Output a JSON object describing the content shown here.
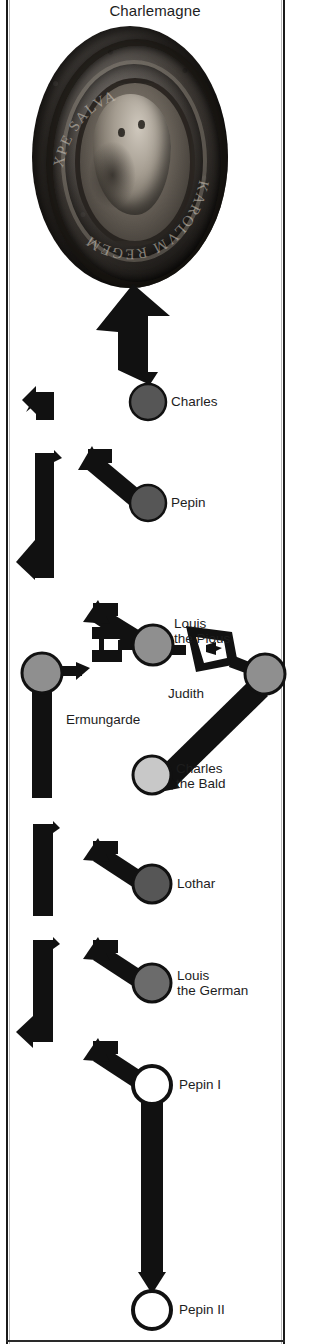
{
  "title": "Charlemagne",
  "portrait": {
    "icon": "seal-medallion-icon",
    "description": "Charlemagne seal portrait bust medallion",
    "inscription_arc_top": "XPE SALVA",
    "inscription_arc_bottom": "KAROLVM REGEM"
  },
  "colors": {
    "node_dark": "#565656",
    "node_medium": "#8f8f8f",
    "node_light": "#c8c8c8",
    "node_empty": "#ffffff",
    "stroke": "#111111",
    "text": "#1d1d1d",
    "frame": "#1a1a1a"
  },
  "tree": {
    "nodes": [
      {
        "id": "charles",
        "label": "Charles",
        "fill": "#565656",
        "cx": 148,
        "cy": 402,
        "r": 18,
        "label_x": 171,
        "label_y": 394
      },
      {
        "id": "pepin",
        "label": "Pepin",
        "fill": "#565656",
        "cx": 148,
        "cy": 503,
        "r": 18,
        "label_x": 171,
        "label_y": 495
      },
      {
        "id": "louis-the-pious",
        "label": "Louis\nthe Pious",
        "fill": "#8f8f8f",
        "cx": 153,
        "cy": 645,
        "r": 20,
        "label_x": 174,
        "label_y": 616
      },
      {
        "id": "ermungarde",
        "label": "Ermungarde",
        "fill": "#8f8f8f",
        "cx": 42,
        "cy": 673,
        "r": 20,
        "label_x": 66,
        "label_y": 712
      },
      {
        "id": "judith",
        "label": "Judith",
        "fill": "#8f8f8f",
        "cx": 265,
        "cy": 674,
        "r": 20,
        "label_x": 168,
        "label_y": 686
      },
      {
        "id": "charles-the-bald",
        "label": "Charles\nthe Bald",
        "fill": "#c8c8c8",
        "cx": 152,
        "cy": 775,
        "r": 19,
        "label_x": 176,
        "label_y": 761
      },
      {
        "id": "lothar",
        "label": "Lothar",
        "fill": "#565656",
        "cx": 152,
        "cy": 884,
        "r": 19,
        "label_x": 177,
        "label_y": 876
      },
      {
        "id": "louis-the-german",
        "label": "Louis\nthe German",
        "fill": "#6b6b6b",
        "cx": 152,
        "cy": 983,
        "r": 19,
        "label_x": 177,
        "label_y": 968
      },
      {
        "id": "pepin-i",
        "label": "Pepin I",
        "fill": "#ffffff",
        "cx": 152,
        "cy": 1085,
        "r": 19,
        "label_x": 179,
        "label_y": 1077
      },
      {
        "id": "pepin-ii",
        "label": "Pepin II",
        "fill": "#ffffff",
        "cx": 152,
        "cy": 1310,
        "r": 19,
        "label_x": 179,
        "label_y": 1302
      }
    ],
    "edges": [
      {
        "id": "charles-to-seal",
        "type": "arrow-up",
        "from": "charles",
        "to": "portrait"
      },
      {
        "id": "spine-to-pepin",
        "type": "arrow-diagonal",
        "from": "spine",
        "to": "pepin"
      },
      {
        "id": "spine-to-louis-the-pious",
        "type": "arrow-diagonal",
        "from": "spine",
        "to": "louis-the-pious"
      },
      {
        "id": "louis-ermungarde-marriage",
        "type": "marriage-link",
        "from": "louis-the-pious",
        "to": "ermungarde"
      },
      {
        "id": "louis-judith-marriage",
        "type": "marriage-link",
        "from": "louis-the-pious",
        "to": "judith"
      },
      {
        "id": "judith-to-charles-the-bald",
        "type": "descent-bar",
        "from": "judith",
        "to": "charles-the-bald"
      },
      {
        "id": "ermungarde-descent",
        "type": "descent-bar",
        "from": "ermungarde",
        "to": "spine"
      },
      {
        "id": "spine-to-lothar",
        "type": "arrow-diagonal",
        "from": "spine",
        "to": "lothar"
      },
      {
        "id": "spine-to-louis-the-german",
        "type": "arrow-diagonal",
        "from": "spine",
        "to": "louis-the-german"
      },
      {
        "id": "spine-to-pepin-i",
        "type": "arrow-diagonal",
        "from": "spine",
        "to": "pepin-i"
      },
      {
        "id": "pepin-i-to-pepin-ii",
        "type": "descent-arrow",
        "from": "pepin-i",
        "to": "pepin-ii"
      }
    ]
  }
}
